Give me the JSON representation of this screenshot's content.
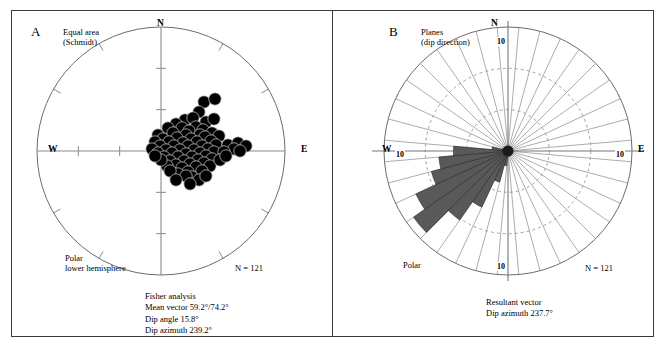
{
  "figure": {
    "background": "#ffffff",
    "frame_color": "#3a3a3a"
  },
  "panel_a": {
    "letter": "A",
    "header": "Equal area\n(Schmidt)",
    "corner_label": "Polar\nlower hemisphere",
    "n_label": "N = 121",
    "compass": {
      "n": "N",
      "e": "E",
      "w": "W"
    },
    "stats": "Fisher analysis\nMean vector 59.2°/74.2°\nDip angle 15.8°\nDip azimuth 239.2°",
    "stats_lines": [
      "Fisher analysis",
      "Mean vector 59.2°/74.2°",
      "Dip angle 15.8°",
      "Dip azimuth 239.2°"
    ]
  },
  "panel_b": {
    "letter": "B",
    "header": "Planes\n(dip direction)",
    "corner_label": "Polar",
    "n_label": "N = 121",
    "compass": {
      "n": "N",
      "e": "E",
      "w": "W"
    },
    "scale_label_n": "10",
    "scale_label_e": "10",
    "scale_label_s": "10",
    "scale_label_w": "10",
    "stats": "Resultant vector\nDip azimuth 237.7°",
    "stats_lines": [
      "Resultant vector",
      "Dip azimuth 237.7°"
    ]
  },
  "chart_data": [
    {
      "type": "scatter",
      "title": "Equal area (Schmidt) polar lower hemisphere stereonet",
      "projection": "equal-area-schmidt",
      "hemisphere": "lower",
      "n": 121,
      "marker_color": "#000000",
      "marker_radius_px": 6.2,
      "center_px": [
        161,
        151
      ],
      "radius_px": 124,
      "axis_labels": [
        "N",
        "E",
        "W"
      ],
      "mean_vector": "59.2/74.2",
      "dip_angle_deg": 15.8,
      "dip_azimuth_deg": 239.2,
      "points_px": [
        [
          204,
          102
        ],
        [
          215,
          99
        ],
        [
          199,
          112
        ],
        [
          185,
          120
        ],
        [
          193,
          118
        ],
        [
          176,
          124
        ],
        [
          206,
          122
        ],
        [
          214,
          119
        ],
        [
          168,
          128
        ],
        [
          182,
          128
        ],
        [
          196,
          127
        ],
        [
          189,
          131
        ],
        [
          203,
          130
        ],
        [
          158,
          135
        ],
        [
          173,
          133
        ],
        [
          186,
          135
        ],
        [
          200,
          135
        ],
        [
          212,
          133
        ],
        [
          163,
          139
        ],
        [
          177,
          138
        ],
        [
          191,
          139
        ],
        [
          205,
          137
        ],
        [
          219,
          136
        ],
        [
          155,
          142
        ],
        [
          169,
          142
        ],
        [
          183,
          143
        ],
        [
          197,
          142
        ],
        [
          211,
          141
        ],
        [
          160,
          146
        ],
        [
          174,
          146
        ],
        [
          188,
          146
        ],
        [
          202,
          146
        ],
        [
          216,
          145
        ],
        [
          152,
          149
        ],
        [
          166,
          150
        ],
        [
          180,
          150
        ],
        [
          194,
          150
        ],
        [
          208,
          149
        ],
        [
          158,
          153
        ],
        [
          172,
          153
        ],
        [
          186,
          154
        ],
        [
          200,
          153
        ],
        [
          214,
          152
        ],
        [
          164,
          157
        ],
        [
          178,
          157
        ],
        [
          192,
          157
        ],
        [
          206,
          156
        ],
        [
          170,
          161
        ],
        [
          184,
          161
        ],
        [
          198,
          160
        ],
        [
          212,
          159
        ],
        [
          176,
          165
        ],
        [
          190,
          164
        ],
        [
          204,
          163
        ],
        [
          182,
          168
        ],
        [
          196,
          167
        ],
        [
          210,
          166
        ],
        [
          188,
          172
        ],
        [
          202,
          171
        ],
        [
          228,
          145
        ],
        [
          238,
          143
        ],
        [
          246,
          146
        ],
        [
          234,
          149
        ],
        [
          224,
          152
        ],
        [
          240,
          151
        ],
        [
          192,
          177
        ],
        [
          199,
          180
        ],
        [
          206,
          176
        ],
        [
          178,
          174
        ],
        [
          186,
          176
        ],
        [
          167,
          166
        ],
        [
          161,
          160
        ],
        [
          155,
          156
        ],
        [
          220,
          160
        ],
        [
          226,
          156
        ],
        [
          170,
          171
        ],
        [
          176,
          180
        ],
        [
          190,
          184
        ]
      ]
    },
    {
      "type": "rose",
      "title": "Planes (dip direction) polar rose diagram",
      "n": 121,
      "petal_color": "#595959",
      "petal_stroke": "#2b2b2b",
      "center_px": [
        506,
        151
      ],
      "radius_px": 124,
      "sector_count": 36,
      "sector_width_deg": 10,
      "radial_max": 10,
      "radial_tick_labels": [
        "10"
      ],
      "grid_rings": [
        3.33,
        6.67,
        10
      ],
      "dashed_rings": [
        3.33,
        6.67
      ],
      "axis_labels": [
        "N",
        "E",
        "W"
      ],
      "resultant_dip_azimuth_deg": 237.7,
      "azimuths_deg": [
        0,
        10,
        20,
        30,
        40,
        50,
        60,
        70,
        80,
        90,
        100,
        110,
        120,
        130,
        140,
        150,
        160,
        170,
        180,
        190,
        200,
        210,
        220,
        230,
        240,
        250,
        260,
        270,
        280,
        290,
        300,
        310,
        320,
        330,
        340,
        350
      ],
      "counts": [
        0,
        0,
        0,
        0,
        0,
        0,
        0,
        0,
        0,
        0.3,
        0,
        0,
        0,
        0,
        0,
        0,
        0,
        0,
        0.4,
        1.2,
        2.6,
        5.0,
        6.8,
        9.3,
        8.2,
        6.4,
        5.6,
        4.4,
        1.3,
        0.5,
        0,
        0,
        0,
        0,
        0,
        0
      ]
    }
  ]
}
